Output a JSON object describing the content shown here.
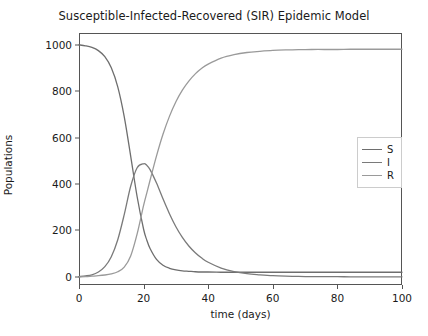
{
  "chart_data": {
    "type": "line",
    "title": "Susceptible-Infected-Recovered (SIR) Epidemic Model",
    "xlabel": "time (days)",
    "ylabel": "Populations",
    "xlim": [
      0,
      100
    ],
    "ylim": [
      -35,
      1050
    ],
    "grid": false,
    "legend_position": "right",
    "xticks": [
      {
        "value": 0,
        "label": "0"
      },
      {
        "value": 20,
        "label": "20"
      },
      {
        "value": 40,
        "label": "40"
      },
      {
        "value": 60,
        "label": "60"
      },
      {
        "value": 80,
        "label": "80"
      },
      {
        "value": 100,
        "label": "100"
      }
    ],
    "yticks": [
      {
        "value": 0,
        "label": "0"
      },
      {
        "value": 200,
        "label": "200"
      },
      {
        "value": 400,
        "label": "400"
      },
      {
        "value": 600,
        "label": "600"
      },
      {
        "value": 800,
        "label": "800"
      },
      {
        "value": 1000,
        "label": "1000"
      }
    ],
    "x": [
      0,
      2,
      4,
      6,
      8,
      10,
      12,
      14,
      16,
      18,
      20,
      21,
      22,
      24,
      26,
      28,
      30,
      32,
      34,
      36,
      38,
      40,
      44,
      48,
      52,
      56,
      60,
      64,
      68,
      72,
      76,
      80,
      84,
      88,
      92,
      96,
      100
    ],
    "series": [
      {
        "name": "S",
        "label": "S",
        "color": "#6e6e6e",
        "values": [
          999,
          995,
          988,
          974,
          948,
          900,
          818,
          690,
          520,
          345,
          205,
          158,
          122,
          75,
          50,
          37,
          30,
          26,
          24,
          22,
          21,
          21,
          20,
          20,
          20,
          20,
          20,
          20,
          20,
          20,
          20,
          20,
          20,
          20,
          20,
          20,
          20
        ]
      },
      {
        "name": "I",
        "label": "I",
        "color": "#7a7a7a",
        "values": [
          1,
          4,
          9,
          21,
          44,
          87,
          160,
          268,
          390,
          470,
          487,
          480,
          462,
          404,
          336,
          272,
          216,
          170,
          133,
          104,
          81,
          63,
          38,
          23,
          14,
          9,
          5,
          3,
          2,
          1,
          1,
          1,
          0,
          0,
          0,
          0,
          0
        ]
      },
      {
        "name": "R",
        "label": "R",
        "color": "#9a9a9a",
        "values": [
          0,
          1,
          3,
          5,
          8,
          13,
          22,
          42,
          90,
          185,
          308,
          362,
          416,
          521,
          614,
          691,
          754,
          804,
          843,
          874,
          898,
          916,
          942,
          957,
          966,
          971,
          975,
          977,
          978,
          979,
          979,
          979,
          980,
          980,
          980,
          980,
          980
        ]
      }
    ],
    "legend": [
      {
        "label": "S",
        "color": "#6e6e6e"
      },
      {
        "label": "I",
        "color": "#7a7a7a"
      },
      {
        "label": "R",
        "color": "#9a9a9a"
      }
    ]
  }
}
